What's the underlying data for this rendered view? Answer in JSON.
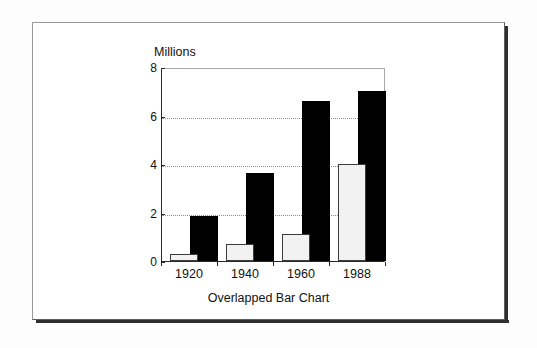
{
  "chart_data": {
    "type": "bar",
    "title": "Overlapped Bar Chart",
    "ylabel": "Millions",
    "xlabel": "",
    "categories": [
      "1920",
      "1940",
      "1960",
      "1988"
    ],
    "ylim": [
      0,
      8
    ],
    "yticks": [
      0,
      2,
      4,
      6,
      8
    ],
    "ytick_labels": [
      "0",
      "2",
      "4",
      "6",
      "8"
    ],
    "grid": "horizontal-dotted-at-2-4-6",
    "legend": "none",
    "overlap": true,
    "series": [
      {
        "name": "front-light-series",
        "color": "#f2f2f2",
        "outline": "#3c3c3c",
        "values": [
          0.3,
          0.7,
          1.1,
          4.0
        ]
      },
      {
        "name": "back-dark-series",
        "color": "#000000",
        "outline": "#000000",
        "values": [
          1.85,
          3.65,
          6.6,
          7.0
        ]
      }
    ]
  },
  "figure": {
    "caption": "Overlapped Bar Chart",
    "y_axis_title": "Millions"
  }
}
